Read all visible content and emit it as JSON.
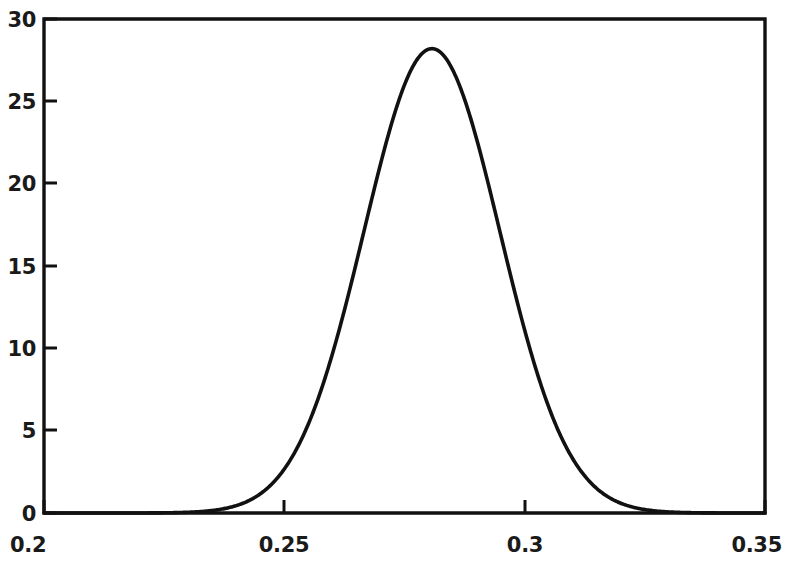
{
  "chart_data": {
    "type": "line",
    "title": "",
    "subtitle": "",
    "xlabel": "",
    "ylabel": "",
    "xlim": [
      0.2,
      0.35
    ],
    "ylim": [
      0,
      30
    ],
    "grid": false,
    "legend": null,
    "legend_position": "none",
    "annotations": [],
    "x_ticks": [
      {
        "value": 0.2,
        "label": "0.2"
      },
      {
        "value": 0.25,
        "label": "0.25"
      },
      {
        "value": 0.3,
        "label": "0.3"
      },
      {
        "value": 0.35,
        "label": "0.35"
      }
    ],
    "y_ticks": [
      {
        "value": 0,
        "label": "0"
      },
      {
        "value": 5,
        "label": "5"
      },
      {
        "value": 10,
        "label": "10"
      },
      {
        "value": 15,
        "label": "15"
      },
      {
        "value": 20,
        "label": "20"
      },
      {
        "value": 25,
        "label": "25"
      },
      {
        "value": 30,
        "label": "30"
      }
    ],
    "curve": {
      "shape": "gaussian",
      "peak_x": 0.2807,
      "peak_y": 28.2,
      "sigma": 0.01414,
      "x": [
        0.2,
        0.205,
        0.21,
        0.215,
        0.22,
        0.225,
        0.23,
        0.235,
        0.24,
        0.245,
        0.25,
        0.255,
        0.26,
        0.265,
        0.27,
        0.275,
        0.2807,
        0.285,
        0.29,
        0.295,
        0.3,
        0.305,
        0.31,
        0.315,
        0.32,
        0.325,
        0.33,
        0.335,
        0.34,
        0.345,
        0.35
      ],
      "y": [
        0.0,
        0.0,
        0.0,
        0.01,
        0.04,
        0.15,
        0.48,
        1.32,
        3.14,
        6.46,
        11.5,
        17.71,
        23.6,
        27.19,
        28.18,
        27.42,
        28.2,
        25.28,
        20.67,
        15.05,
        9.75,
        5.59,
        2.85,
        1.29,
        0.52,
        0.18,
        0.06,
        0.02,
        0.0,
        0.0,
        0.0
      ]
    },
    "series": [
      {
        "name": "probability density",
        "peak_value": 28.2,
        "peak_at": 0.2807
      }
    ]
  },
  "figure": {
    "background_color": "#ffffff",
    "line_color": "#111111",
    "text_color": "#1a1a1a",
    "frame": "box"
  }
}
